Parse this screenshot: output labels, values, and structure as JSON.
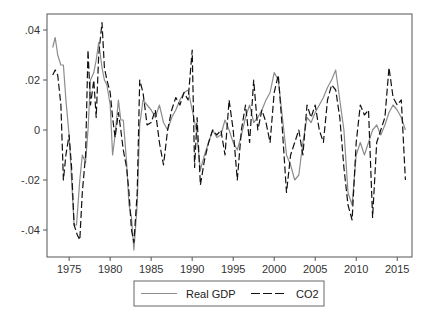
{
  "chart_data": {
    "type": "line",
    "title": "",
    "xlabel": "",
    "ylabel": "",
    "xlim": [
      1972.3,
      2016.8
    ],
    "ylim": [
      -0.0508,
      0.0464
    ],
    "grid": false,
    "legend_position": "bottom",
    "x_ticks": [
      1975,
      1980,
      1985,
      1990,
      1995,
      2000,
      2005,
      2010,
      2015
    ],
    "x_tick_labels": [
      "1975",
      "1980",
      "1985",
      "1990",
      "1995",
      "2000",
      "2005",
      "2010",
      "2015"
    ],
    "y_ticks": [
      0.04,
      0.02,
      0,
      -0.02,
      -0.04
    ],
    "y_tick_labels": [
      ".04",
      ".02",
      "0",
      "-.02",
      "-.04"
    ],
    "series": [
      {
        "name": "Real GDP",
        "style": "solid",
        "color": "#8c8c8c",
        "x": [
          1973.0,
          1973.3,
          1973.6,
          1974.0,
          1974.3,
          1974.6,
          1975.0,
          1975.3,
          1975.6,
          1975.9,
          1976.3,
          1976.6,
          1977.0,
          1977.3,
          1977.6,
          1978.0,
          1978.3,
          1978.6,
          1979.0,
          1979.3,
          1979.6,
          1980.0,
          1980.3,
          1980.6,
          1981.0,
          1981.3,
          1981.6,
          1982.0,
          1982.3,
          1982.6,
          1982.9,
          1983.3,
          1983.6,
          1984.0,
          1984.5,
          1985.0,
          1985.5,
          1986.0,
          1986.5,
          1987.0,
          1987.5,
          1988.0,
          1988.5,
          1989.0,
          1989.5,
          1990.0,
          1990.5,
          1991.0,
          1991.5,
          1992.0,
          1992.5,
          1993.0,
          1993.5,
          1994.0,
          1994.5,
          1995.0,
          1995.5,
          1996.0,
          1996.5,
          1997.0,
          1997.5,
          1998.0,
          1998.5,
          1999.0,
          1999.5,
          2000.0,
          2000.5,
          2001.0,
          2001.5,
          2002.0,
          2002.5,
          2003.0,
          2003.5,
          2004.0,
          2004.5,
          2005.0,
          2005.5,
          2006.0,
          2006.5,
          2007.0,
          2007.5,
          2008.0,
          2008.5,
          2009.0,
          2009.5,
          2010.0,
          2010.5,
          2011.0,
          2011.5,
          2012.0,
          2012.5,
          2013.0,
          2013.5,
          2014.0,
          2014.5,
          2015.0,
          2015.5,
          2016.0
        ],
        "values": [
          0.033,
          0.037,
          0.03,
          0.026,
          0.026,
          0.012,
          -0.002,
          -0.02,
          -0.038,
          -0.038,
          -0.02,
          -0.01,
          -0.013,
          0.0,
          0.02,
          0.023,
          0.028,
          0.035,
          0.025,
          0.02,
          0.018,
          0.01,
          -0.01,
          -0.002,
          0.012,
          0.004,
          0.004,
          -0.013,
          -0.03,
          -0.035,
          -0.048,
          -0.03,
          0.002,
          0.012,
          0.01,
          0.008,
          0.005,
          0.01,
          0.003,
          0.0,
          0.005,
          0.008,
          0.012,
          0.015,
          0.016,
          0.008,
          0.0,
          -0.016,
          -0.01,
          -0.005,
          0.0,
          -0.003,
          -0.002,
          0.004,
          0.0,
          -0.005,
          -0.008,
          -0.002,
          0.005,
          0.01,
          0.003,
          0.005,
          0.008,
          0.012,
          0.015,
          0.023,
          0.02,
          0.005,
          -0.01,
          -0.014,
          -0.02,
          -0.018,
          -0.005,
          0.005,
          0.003,
          0.007,
          0.01,
          0.013,
          0.017,
          0.02,
          0.024,
          0.012,
          0.0,
          -0.025,
          -0.03,
          -0.01,
          -0.005,
          -0.01,
          -0.005,
          0.0,
          0.002,
          -0.002,
          0.002,
          0.007,
          0.01,
          0.008,
          0.005,
          0.0
        ]
      },
      {
        "name": "CO2",
        "style": "dashed",
        "color": "#111111",
        "x": [
          1973.0,
          1973.3,
          1973.6,
          1974.0,
          1974.3,
          1974.6,
          1975.0,
          1975.3,
          1975.6,
          1976.0,
          1976.3,
          1976.6,
          1977.0,
          1977.3,
          1977.6,
          1978.0,
          1978.3,
          1978.6,
          1979.0,
          1979.3,
          1979.6,
          1980.0,
          1980.3,
          1980.6,
          1981.0,
          1981.3,
          1981.6,
          1982.0,
          1982.3,
          1982.6,
          1982.9,
          1983.3,
          1983.6,
          1984.0,
          1984.5,
          1985.0,
          1985.5,
          1986.0,
          1986.5,
          1987.0,
          1987.5,
          1988.0,
          1988.5,
          1989.0,
          1989.5,
          1990.0,
          1990.3,
          1990.6,
          1991.0,
          1991.5,
          1992.0,
          1992.5,
          1993.0,
          1993.5,
          1994.0,
          1994.5,
          1995.0,
          1995.5,
          1996.0,
          1996.5,
          1997.0,
          1997.5,
          1998.0,
          1998.5,
          1999.0,
          1999.5,
          2000.0,
          2000.5,
          2001.0,
          2001.5,
          2002.0,
          2002.5,
          2003.0,
          2003.5,
          2004.0,
          2004.5,
          2005.0,
          2005.5,
          2006.0,
          2006.5,
          2007.0,
          2007.5,
          2008.0,
          2008.5,
          2009.0,
          2009.5,
          2010.0,
          2010.5,
          2011.0,
          2011.5,
          2012.0,
          2012.5,
          2013.0,
          2013.5,
          2014.0,
          2014.5,
          2015.0,
          2015.5,
          2016.0
        ],
        "values": [
          0.022,
          0.024,
          0.022,
          0.01,
          -0.02,
          -0.01,
          -0.002,
          -0.015,
          -0.038,
          -0.042,
          -0.044,
          -0.025,
          -0.01,
          0.032,
          0.01,
          0.02,
          0.005,
          0.03,
          0.043,
          0.025,
          0.02,
          0.015,
          0.005,
          -0.003,
          0.007,
          0.0,
          -0.008,
          -0.015,
          -0.025,
          -0.04,
          -0.045,
          -0.025,
          0.02,
          0.015,
          0.002,
          0.003,
          0.008,
          -0.005,
          -0.014,
          0.0,
          0.008,
          0.013,
          0.01,
          0.015,
          0.012,
          0.032,
          -0.015,
          0.005,
          -0.022,
          -0.012,
          -0.005,
          0.0,
          -0.002,
          0.0,
          -0.01,
          0.012,
          0.0,
          -0.02,
          0.0,
          0.01,
          -0.005,
          0.02,
          0.0,
          0.008,
          0.003,
          -0.005,
          0.015,
          0.022,
          0.0,
          -0.025,
          -0.01,
          -0.005,
          0.0,
          -0.01,
          0.01,
          0.005,
          0.01,
          0.0,
          -0.005,
          0.012,
          0.018,
          0.016,
          0.005,
          -0.015,
          -0.03,
          -0.036,
          -0.005,
          0.01,
          0.006,
          0.008,
          -0.035,
          -0.005,
          0.0,
          0.005,
          0.025,
          0.013,
          0.01,
          0.012,
          -0.02
        ]
      }
    ]
  },
  "legend": {
    "items": [
      {
        "label": "Real GDP",
        "style": "solid",
        "color": "#8c8c8c"
      },
      {
        "label": "CO2",
        "style": "dashed",
        "color": "#111111"
      }
    ]
  }
}
